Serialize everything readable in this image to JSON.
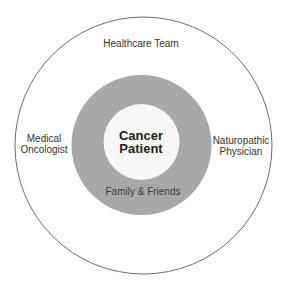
{
  "diagram": {
    "colors": {
      "background": "#ffffff",
      "outer_circle_stroke": "#6e6e6e",
      "ring_fill": "#a8a8a8",
      "center_fill": "#f7f7f7",
      "text": "#333333"
    },
    "outer_circle": {
      "label": "Healthcare Team",
      "members": [
        {
          "line1": "Medical",
          "line2": "Oncologist"
        },
        {
          "line1": "Naturopathic",
          "line2": "Physician"
        }
      ]
    },
    "middle_ring": {
      "label": "Family & Friends"
    },
    "center": {
      "line1": "Cancer",
      "line2": "Patient"
    }
  }
}
